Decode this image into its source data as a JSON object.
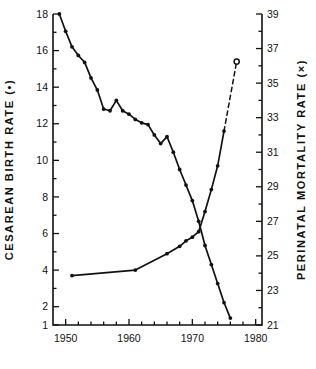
{
  "chart_data": {
    "type": "line",
    "title": "",
    "xlabel": "",
    "ylabel": "CESAREAN BIRTH RATE (•)",
    "y2label": "PERINATAL MORTALITY RATE (×)",
    "grid": false,
    "legend": "none",
    "xlim": [
      1948,
      1981
    ],
    "xticks": [
      1950,
      1960,
      1970,
      1980
    ],
    "xtick_labels": [
      "1950",
      "1960",
      "1970",
      "1980"
    ],
    "xminor_step": 2,
    "ylim": [
      1,
      18
    ],
    "yticks": [
      2,
      4,
      6,
      8,
      10,
      12,
      14,
      16,
      18
    ],
    "ytick_labels": [
      "2",
      "4",
      "6",
      "8",
      "10",
      "12",
      "14",
      "16",
      "18"
    ],
    "ytick_extra": [
      1
    ],
    "ytick_extra_labels": [
      "1"
    ],
    "yminor_step": 1,
    "y2lim": [
      21,
      39
    ],
    "y2ticks": [
      21,
      23,
      25,
      27,
      29,
      31,
      33,
      35,
      37,
      39
    ],
    "y2tick_labels": [
      "21",
      "23",
      "25",
      "27",
      "29",
      "31",
      "33",
      "35",
      "37",
      "39"
    ],
    "y2minor_step": 1,
    "series": [
      {
        "name": "PERINATAL MORTALITY RATE",
        "axis": "right",
        "marker": "×",
        "style": "solid",
        "x": [
          1949,
          1950,
          1951,
          1952,
          1953,
          1954,
          1955,
          1956,
          1957,
          1958,
          1959,
          1960,
          1961,
          1962,
          1963,
          1964,
          1965,
          1966,
          1967,
          1968,
          1969,
          1970,
          1971,
          1972,
          1973,
          1974,
          1975,
          1976
        ],
        "values": [
          39.0,
          38.0,
          37.1,
          36.6,
          36.2,
          35.3,
          34.6,
          33.5,
          33.4,
          34.0,
          33.4,
          33.2,
          32.9,
          32.7,
          32.6,
          32.0,
          31.5,
          31.9,
          31.0,
          30.0,
          29.1,
          28.2,
          27.0,
          25.6,
          24.5,
          23.4,
          22.3,
          21.4
        ]
      },
      {
        "name": "CESAREAN BIRTH RATE",
        "axis": "left",
        "marker": "•",
        "style": "solid",
        "x": [
          1951,
          1961,
          1966,
          1968,
          1969,
          1970,
          1971,
          1972,
          1973,
          1974,
          1975
        ],
        "values": [
          3.7,
          4.0,
          4.9,
          5.3,
          5.6,
          5.8,
          6.1,
          7.2,
          8.4,
          9.7,
          11.6
        ]
      },
      {
        "name": "CESAREAN BIRTH RATE PROJECTED",
        "axis": "left",
        "marker": "○",
        "style": "dashed",
        "x": [
          1975,
          1977
        ],
        "values": [
          11.6,
          15.4
        ]
      }
    ]
  },
  "labels": {
    "left_axis_title": "CESAREAN BIRTH RATE (•)",
    "right_axis_title": "PERINATAL MORTALITY RATE (×)"
  },
  "colors": {
    "ink": "#111111",
    "background": "#ffffff"
  }
}
